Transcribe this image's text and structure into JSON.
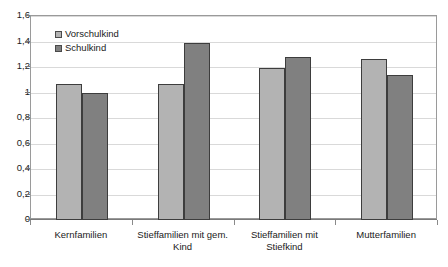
{
  "chart_data": {
    "type": "bar",
    "title": "",
    "subtitle": "",
    "xlabel": "",
    "ylabel": "",
    "ylim": [
      0,
      1.6
    ],
    "y_ticks": [
      0,
      0.2,
      0.4,
      0.6,
      0.8,
      1,
      1.2,
      1.4,
      1.6
    ],
    "y_tick_labels": [
      "0",
      "0,2",
      "0,4",
      "0,6",
      "0,8",
      "1",
      "1,2",
      "1,4",
      "1,6"
    ],
    "grid": true,
    "legend_position": "top-left",
    "categories": [
      "Kernfamilien",
      "Stieffamilien mit gem. Kind",
      "Stieffamilien mit Stiefkind",
      "Mutterfamilien"
    ],
    "series": [
      {
        "name": "Vorschulkind",
        "color": "#b3b3b3",
        "values": [
          1.07,
          1.07,
          1.19,
          1.26
        ]
      },
      {
        "name": "Schulkind",
        "color": "#808080",
        "values": [
          1.0,
          1.39,
          1.28,
          1.14
        ]
      }
    ]
  },
  "colors": {
    "series_light": "#b3b3b3",
    "series_dark": "#808080",
    "bar_border": "#3d3d3d",
    "gridline": "#d9d9d9",
    "axis": "#7a7a7a",
    "frame": "#9a9a9a",
    "background": "#ffffff",
    "text": "#1a1a1a"
  }
}
